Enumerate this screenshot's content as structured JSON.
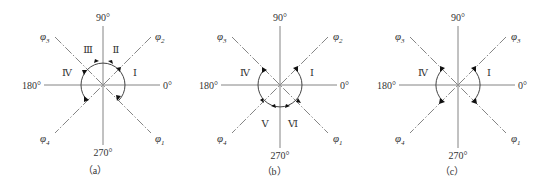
{
  "figure": {
    "panels": [
      {
        "id": "a",
        "caption": "（a）",
        "angles": {
          "top": "90°",
          "bottom": "270°",
          "left": "180°",
          "right": "0°"
        },
        "phases": {
          "lower_right": {
            "symbol": "φ",
            "sub": "1"
          },
          "upper_right": {
            "symbol": "φ",
            "sub": "2"
          },
          "upper_left": {
            "symbol": "φ",
            "sub": "3"
          },
          "lower_left": {
            "symbol": "φ",
            "sub": "4"
          }
        },
        "regions": [
          "Ⅰ",
          "Ⅱ",
          "Ⅲ",
          "Ⅳ"
        ],
        "arc": "upper semicircle from φ1 through φ2, φ3 to φ4 with arrows (regions I–IV)"
      },
      {
        "id": "b",
        "caption": "（b）",
        "angles": {
          "top": "90°",
          "bottom": "270°",
          "left": "180°",
          "right": "0°"
        },
        "phases": {
          "lower_right": {
            "symbol": "φ",
            "sub": "1"
          },
          "upper_right": {
            "symbol": "φ",
            "sub": "2"
          },
          "upper_left": {
            "symbol": "φ",
            "sub": "3"
          },
          "lower_left": {
            "symbol": "φ",
            "sub": "4"
          }
        },
        "regions": [
          "Ⅰ",
          "Ⅳ",
          "Ⅴ",
          "Ⅵ"
        ],
        "arc": "lower semicircle from φ2 through φ1, φ4 to φ3 with arrows (regions I, VI, V, IV)"
      },
      {
        "id": "c",
        "caption": "（c）",
        "angles": {
          "top": "90°",
          "bottom": "270°",
          "left": "180°",
          "right": "0°"
        },
        "phases": {
          "lower_right": {
            "symbol": "φ",
            "sub": "1"
          },
          "upper_right": {
            "symbol": "φ",
            "sub": "3"
          },
          "upper_left": {
            "symbol": "φ",
            "sub": "3"
          },
          "lower_left": {
            "symbol": "φ",
            "sub": "4"
          }
        },
        "regions": [
          "Ⅰ",
          "Ⅳ"
        ],
        "arc": "two separate arcs: right arc between φ3 (upper-right) and φ1, left arc between φ3 (upper-left) and φ4"
      }
    ]
  }
}
